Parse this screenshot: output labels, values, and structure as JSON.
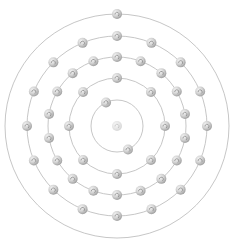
{
  "diagram": {
    "type": "bohr-atom-model",
    "center": [
      117,
      126
    ],
    "nucleus": {
      "radius": 5,
      "color": "#dcdcdc"
    },
    "shell_color": "#b8b8b8",
    "electron": {
      "radius": 5,
      "highlight": "#f4f4f4",
      "shade": "#9a9a9a"
    },
    "shells": [
      {
        "name": "shell-1",
        "radius": 26,
        "electrons": 2,
        "start_angle": -115
      },
      {
        "name": "shell-2",
        "radius": 48,
        "electrons": 8,
        "start_angle": -90
      },
      {
        "name": "shell-3",
        "radius": 69,
        "electrons": 18,
        "start_angle": -90
      },
      {
        "name": "shell-4",
        "radius": 90,
        "electrons": 16,
        "start_angle": -90
      },
      {
        "name": "shell-5",
        "radius": 112,
        "electrons": 1,
        "start_angle": -90
      }
    ],
    "electron_configuration": [
      2,
      8,
      18,
      16,
      1
    ],
    "total_electrons": 45
  }
}
